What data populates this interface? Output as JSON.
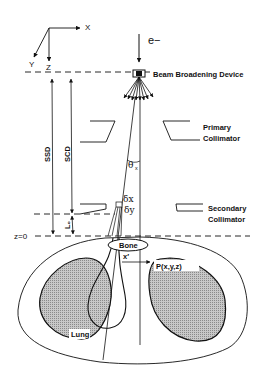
{
  "diagram": {
    "type": "electron-beam-geometry",
    "axes": {
      "x": "X",
      "y": "Y",
      "z": "Z"
    },
    "source": {
      "label": "e−"
    },
    "components": {
      "beam_device": "Beam Broadening Device",
      "primary_collimator_line1": "Primary",
      "primary_collimator_line2": "Collimator",
      "secondary_collimator_line1": "Secondary",
      "secondary_collimator_line2": "Collimator"
    },
    "distances": {
      "ssd": "SSD",
      "scd": "SCD",
      "lo": "L₀",
      "z0": "z=0",
      "x_prime": "x′"
    },
    "angles": {
      "theta": "θ",
      "theta_sub": "x",
      "delta_x": "δx",
      "delta_y": "δy"
    },
    "anatomy": {
      "bone": "Bone",
      "lung": "Lung",
      "point": "P(x,y,z)"
    },
    "colors": {
      "line": "#111111",
      "lung_fill": "#b4b4b4",
      "background": "#ffffff"
    }
  }
}
